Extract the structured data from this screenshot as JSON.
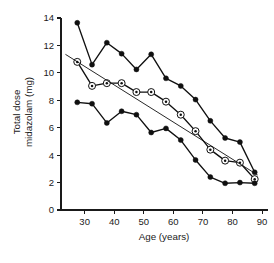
{
  "chart_data": {
    "type": "line",
    "title": "",
    "subtitle": "",
    "xlabel": "Age (years)",
    "ylabel": "Total dose midazolam (mg)",
    "ylabel_line1": "Total dose",
    "ylabel_line2": "midazolam (mg)",
    "xlim": [
      22,
      92
    ],
    "ylim": [
      0,
      14
    ],
    "xticks": [
      30,
      40,
      50,
      60,
      70,
      80,
      90
    ],
    "yticks": [
      0,
      2,
      4,
      6,
      8,
      10,
      12,
      14
    ],
    "xtick_labels": [
      "30",
      "40",
      "50",
      "60",
      "70",
      "80",
      "90"
    ],
    "ytick_labels": [
      "0",
      "2",
      "4",
      "6",
      "8",
      "10",
      "12",
      "14"
    ],
    "grid": false,
    "legend": "none",
    "x": [
      27.5,
      32.5,
      37.5,
      42.5,
      47.5,
      52.5,
      57.5,
      62.5,
      67.5,
      72.5,
      77.5,
      82.5,
      87.5
    ],
    "series": [
      {
        "name": "upper-percentile",
        "marker": "filled-circle",
        "values": [
          13.65,
          10.6,
          12.2,
          11.4,
          10.25,
          11.35,
          9.6,
          9.05,
          8.05,
          6.5,
          5.25,
          4.95,
          2.75
        ]
      },
      {
        "name": "median",
        "marker": "ringed-dot",
        "values": [
          10.8,
          9.05,
          9.25,
          9.25,
          8.6,
          8.6,
          7.9,
          6.95,
          5.75,
          4.4,
          3.6,
          3.45,
          2.25
        ]
      },
      {
        "name": "lower-percentile",
        "marker": "filled-circle",
        "values": [
          7.85,
          7.75,
          6.35,
          7.2,
          6.95,
          5.65,
          5.95,
          5.1,
          3.65,
          2.4,
          1.95,
          2.0,
          1.95
        ]
      }
    ],
    "regression_line": {
      "name": "fitted-regression",
      "x_start": 23.5,
      "y_start": 11.35,
      "x_end": 88.5,
      "y_end": 2.55
    }
  }
}
